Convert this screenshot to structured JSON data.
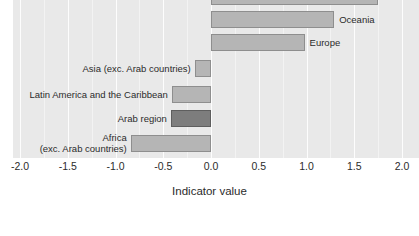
{
  "chart_data": {
    "type": "bar",
    "orientation": "horizontal",
    "title": "",
    "xlabel": "Indicator value",
    "ylabel": "",
    "xlim": [
      -2.0,
      2.0
    ],
    "xticks": [
      "-2.0",
      "-1.5",
      "-1.0",
      "-0.5",
      "0.0",
      "0.5",
      "1.0",
      "1.5",
      "2.0"
    ],
    "xtick_values": [
      -2.0,
      -1.5,
      -1.0,
      -0.5,
      0.0,
      0.5,
      1.0,
      1.5,
      2.0
    ],
    "grid": true,
    "legend": "none",
    "categories": [
      "",
      "Oceania",
      "Europe",
      "Asia (exc. Arab countries)",
      "Latin America and the Caribbean",
      "Arab region",
      "Africa\n(exc. Arab countries)"
    ],
    "values": [
      1.75,
      1.29,
      0.98,
      -0.17,
      -0.41,
      -0.42,
      -0.84
    ],
    "bars": [
      {
        "label": "",
        "label_line1": "",
        "label_line2": "",
        "value": 1.75,
        "side": "right",
        "highlight": false,
        "label_visible": false
      },
      {
        "label": "Oceania",
        "label_line1": "Oceania",
        "label_line2": "",
        "value": 1.29,
        "side": "right",
        "highlight": false,
        "label_visible": true
      },
      {
        "label": "Europe",
        "label_line1": "Europe",
        "label_line2": "",
        "value": 0.98,
        "side": "right",
        "highlight": false,
        "label_visible": true
      },
      {
        "label": "Asia (exc. Arab countries)",
        "label_line1": "Asia (exc. Arab countries)",
        "label_line2": "",
        "value": -0.17,
        "side": "left",
        "highlight": false,
        "label_visible": true
      },
      {
        "label": "Latin America and the Caribbean",
        "label_line1": "Latin America and the Caribbean",
        "label_line2": "",
        "value": -0.41,
        "side": "left",
        "highlight": false,
        "label_visible": true
      },
      {
        "label": "Arab region",
        "label_line1": "Arab region",
        "label_line2": "",
        "value": -0.42,
        "side": "left",
        "highlight": true,
        "label_visible": true
      },
      {
        "label": "Africa (exc. Arab countries)",
        "label_line1": "Africa",
        "label_line2": "(exc. Arab countries)",
        "value": -0.84,
        "side": "left",
        "highlight": false,
        "label_visible": true
      }
    ],
    "colors": {
      "bar_fill": "#b5b5b5",
      "bar_stroke": "#8e8e8e",
      "highlight_fill": "#7d7d7d",
      "highlight_stroke": "#5e5e5e",
      "panel_background": "#e9e9e9",
      "gridline": "#fdfdfd",
      "text": "#2b2b2b"
    }
  }
}
